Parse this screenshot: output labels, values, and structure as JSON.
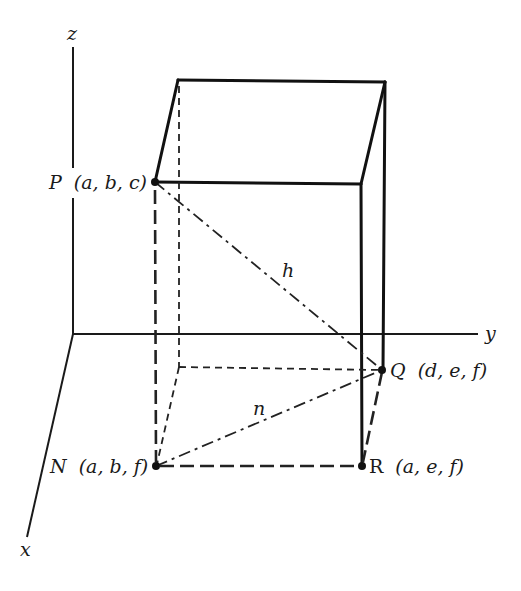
{
  "axes": {
    "x_label": "x",
    "y_label": "y",
    "z_label": "z"
  },
  "points": {
    "P": {
      "name": "P",
      "coords": "(a,  b,  c)"
    },
    "Q": {
      "name": "Q",
      "coords": "(d,  e,  f)"
    },
    "N": {
      "name": "N",
      "coords": "(a,  b,  f)"
    },
    "R": {
      "name": "R",
      "coords": "(a,  e,  f)"
    }
  },
  "segments": {
    "h_label": "h",
    "n_label": "n"
  },
  "colors": {
    "line": "#111111",
    "background": "#ffffff"
  }
}
